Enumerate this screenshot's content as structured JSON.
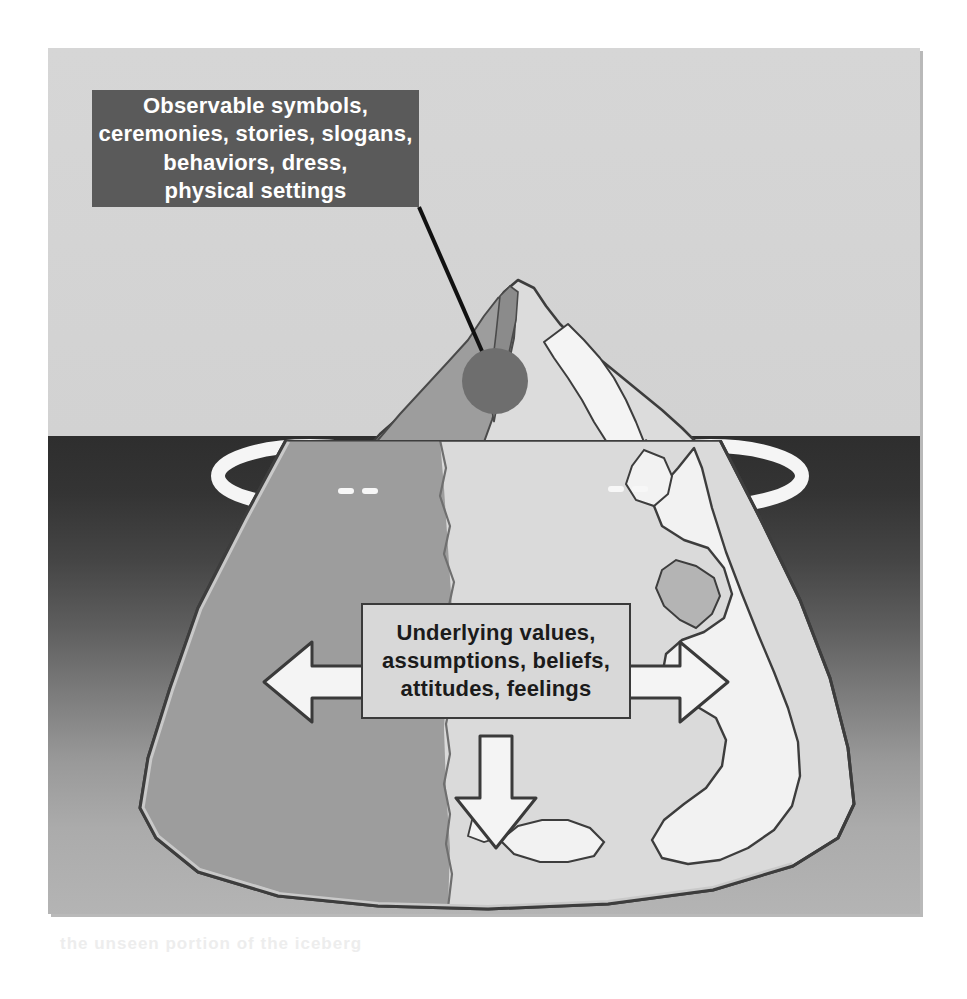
{
  "figure": {
    "panel_background": "#d4d4d4",
    "water_color_top": "#2e2e2e",
    "water_color_bottom": "#b4b4b4"
  },
  "callouts": {
    "visible": {
      "id": "observable-culture-callout",
      "background": "#5a5a5a",
      "text_color": "#ffffff",
      "lines": [
        "Observable symbols,",
        "ceremonies, stories, slogans,",
        "behaviors, dress,",
        "physical settings"
      ],
      "full_text": "Observable symbols, ceremonies, stories, slogans, behaviors, dress, physical settings"
    },
    "hidden": {
      "id": "underlying-culture-callout",
      "background": "#d8d8d8",
      "text_color": "#1b1b1b",
      "border_color": "#3a3a3a",
      "lines": [
        "Underlying values,",
        "assumptions, beliefs,",
        "attitudes, feelings"
      ],
      "full_text": "Underlying values, assumptions, beliefs, attitudes, feelings"
    }
  },
  "markers": {
    "leader_line": "pointer-line-to-iceberg-tip",
    "tip_dot": "iceberg-tip-marker-dot",
    "tip_dot_color": "#6e6e6e"
  },
  "arrows": [
    {
      "name": "left-arrow",
      "direction": "left",
      "fill": "#f4f4f4",
      "stroke": "#3a3a3a"
    },
    {
      "name": "right-arrow",
      "direction": "right",
      "fill": "#f4f4f4",
      "stroke": "#3a3a3a"
    },
    {
      "name": "down-arrow",
      "direction": "down",
      "fill": "#f4f4f4",
      "stroke": "#3a3a3a"
    }
  ],
  "iceberg": {
    "above_water_label": "visible-tip",
    "below_water_label": "submerged-mass",
    "light_face": "#dcdcdc",
    "shadow_face": "#9d9d9d",
    "highlight": "#f2f2f2",
    "outline": "#3d3d3d"
  },
  "ghost_text": {
    "bottom": "the unseen portion of the iceberg",
    "middle": ""
  }
}
